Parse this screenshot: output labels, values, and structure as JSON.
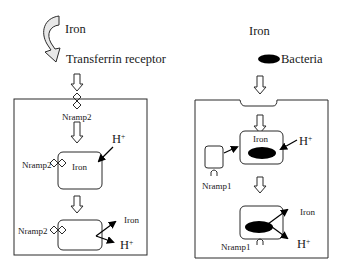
{
  "left_panel": {
    "iron_label": "Iron",
    "transferrin_label": "Transferrin receptor",
    "nramp2_top_label": "Nramp2",
    "vesicle1": {
      "inner_label": "Iron",
      "nramp_label": "Nramp2",
      "proton_label": "H",
      "proton_sup": "+"
    },
    "vesicle2": {
      "nramp_label": "Nramp2",
      "iron_out_label": "Iron",
      "proton_label": "H",
      "proton_sup": "+"
    }
  },
  "right_panel": {
    "iron_label": "Iron",
    "bacteria_label": "Bacteria",
    "vesicle1": {
      "inner_label": "Iron",
      "proton_label": "H",
      "proton_sup": "+"
    },
    "nramp1_side_label": "Nramp1",
    "vesicle2": {
      "nramp_label": "Nramp1",
      "iron_out_label": "Iron",
      "proton_label": "H",
      "proton_sup": "+"
    }
  },
  "colors": {
    "stroke": "#2a2a2a",
    "fill_dark": "#000000",
    "curved_arrow_fill": "#e8e8e8"
  }
}
